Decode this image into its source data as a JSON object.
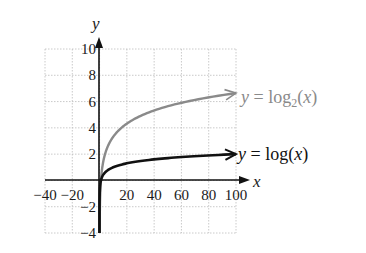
{
  "chart_data": {
    "type": "line",
    "title": "",
    "xlabel": "x",
    "ylabel": "y",
    "xlim": [
      -40,
      100
    ],
    "ylim": [
      -4,
      10
    ],
    "grid": true,
    "x_ticks": [
      -40,
      -20,
      20,
      40,
      60,
      80,
      100
    ],
    "y_ticks": [
      -4,
      -2,
      2,
      4,
      6,
      8,
      10
    ],
    "x_tick_labels": [
      "−40",
      "−20",
      "20",
      "40",
      "60",
      "80",
      "100"
    ],
    "y_tick_labels": [
      "−4",
      "−2",
      "2",
      "4",
      "6",
      "8",
      "10"
    ],
    "series": [
      {
        "name": "y = log2(x)",
        "label_parts": {
          "y": "y",
          "eq": " = log",
          "sub": "2",
          "open": "(",
          "x": "x",
          "close": ")"
        },
        "color": "#8a8a8a",
        "function": "log2",
        "x": [
          0.06,
          0.5,
          1,
          2,
          5,
          10,
          20,
          40,
          60,
          80,
          100
        ],
        "values": [
          -4,
          -1,
          0,
          1,
          2.32,
          3.32,
          4.32,
          5.32,
          5.91,
          6.32,
          6.64
        ]
      },
      {
        "name": "y = log(x)",
        "label_parts": {
          "y": "y",
          "eq": " = log",
          "sub": "",
          "open": "(",
          "x": "x",
          "close": ")"
        },
        "color": "#111111",
        "function": "log10",
        "x": [
          0.0001,
          0.01,
          0.1,
          1,
          5,
          10,
          20,
          40,
          60,
          80,
          100
        ],
        "values": [
          -4,
          -2,
          -1,
          0,
          0.7,
          1,
          1.3,
          1.6,
          1.78,
          1.9,
          2
        ]
      }
    ],
    "annotations": [
      "y = log2(x)",
      "y = log(x)"
    ]
  }
}
